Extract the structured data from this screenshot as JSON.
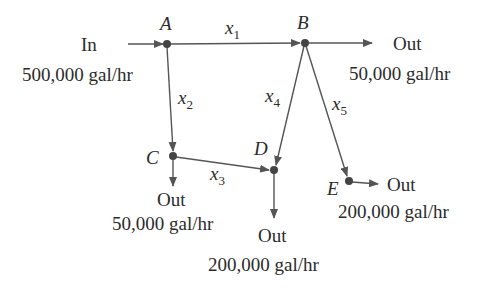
{
  "diagram": {
    "type": "flow-network",
    "colors": {
      "line": "#555555",
      "node": "#444444",
      "text": "#2b2b2b"
    },
    "nodes": [
      {
        "id": "A",
        "label": "A",
        "x": 167,
        "y": 44
      },
      {
        "id": "B",
        "label": "B",
        "x": 305,
        "y": 43
      },
      {
        "id": "C",
        "label": "C",
        "x": 173,
        "y": 156
      },
      {
        "id": "D",
        "label": "D",
        "x": 274,
        "y": 170
      },
      {
        "id": "E",
        "label": "E",
        "x": 349,
        "y": 181
      }
    ],
    "edges": [
      {
        "from": "A",
        "to": "B",
        "var": "x",
        "sub": "1"
      },
      {
        "from": "A",
        "to": "C",
        "var": "x",
        "sub": "2"
      },
      {
        "from": "C",
        "to": "D",
        "var": "x",
        "sub": "3"
      },
      {
        "from": "B",
        "to": "D",
        "var": "x",
        "sub": "4"
      },
      {
        "from": "B",
        "to": "E",
        "var": "x",
        "sub": "5"
      }
    ],
    "inflow": {
      "node": "A",
      "label": "In",
      "rate": "500,000 gal/hr"
    },
    "outflows": [
      {
        "node": "B",
        "label": "Out",
        "rate": "50,000 gal/hr"
      },
      {
        "node": "C",
        "label": "Out",
        "rate": "50,000 gal/hr"
      },
      {
        "node": "D",
        "label": "Out",
        "rate": "200,000 gal/hr"
      },
      {
        "node": "E",
        "label": "Out",
        "rate": "200,000 gal/hr"
      }
    ]
  }
}
